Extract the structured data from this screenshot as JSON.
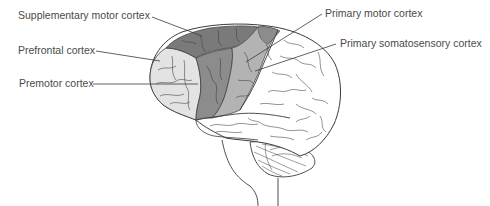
{
  "figure": {
    "type": "labeled anatomical diagram",
    "labels": [
      {
        "id": "supplementary-motor",
        "text": "Supplementary motor cortex",
        "x": 18,
        "y": 14
      },
      {
        "id": "prefrontal",
        "text": "Prefrontal cortex",
        "x": 18,
        "y": 47
      },
      {
        "id": "premotor",
        "text": "Premotor cortex",
        "x": 19,
        "y": 80
      },
      {
        "id": "primary-motor",
        "text": "Primary motor cortex",
        "x": 325,
        "y": 10
      },
      {
        "id": "primary-somatosensory",
        "text": "Primary somatosensory cortex",
        "x": 340,
        "y": 40
      }
    ],
    "colors": {
      "prefrontal_fill": "#e3e3e3",
      "premotor_fill": "#8c8c8c",
      "supplementary_fill": "#7a7a7a",
      "primary_motor_fill": "#b3b3b3",
      "cortex_fill": "#ffffff",
      "outline": "#3a3a3a",
      "label_text": "#4a4a4a"
    }
  }
}
